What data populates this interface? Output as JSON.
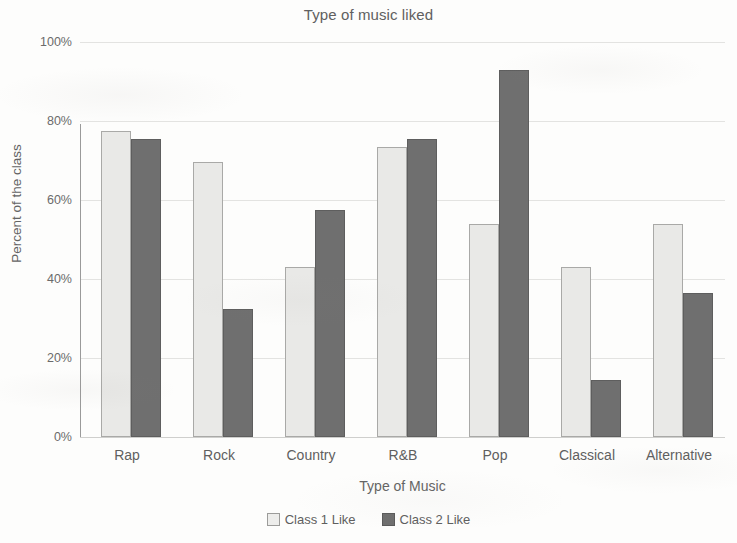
{
  "chart_data": {
    "type": "bar",
    "title": "Type of music liked",
    "xlabel": "Type of Music",
    "ylabel": "Percent of the class",
    "categories": [
      "Rap",
      "Rock",
      "Country",
      "R&B",
      "Pop",
      "Classical",
      "Alternative"
    ],
    "series": [
      {
        "name": "Class 1 Like",
        "color": "#e9e9e7",
        "values": [
          77,
          69,
          42.5,
          73,
          53.5,
          42.5,
          53.5
        ]
      },
      {
        "name": "Class 2 Like",
        "color": "#6f6f6f",
        "values": [
          75,
          32,
          57,
          75,
          92.5,
          14,
          36
        ]
      }
    ],
    "ylim": [
      0,
      100
    ],
    "ytick_values": [
      100,
      80,
      60,
      40,
      20,
      0
    ],
    "ytick_labels": [
      "100%",
      "80%",
      "60%",
      "40%",
      "20%",
      "0%"
    ],
    "grid": true,
    "grid_axis": "y",
    "legend_position": "bottom",
    "value_format": "percent"
  }
}
